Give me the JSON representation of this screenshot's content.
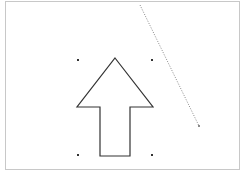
{
  "canvas": {
    "background": "#ffffff",
    "border_color": "#c8c8c8"
  },
  "shapes": {
    "arrow": {
      "type": "up-arrow",
      "stroke": "#333333",
      "fill": "#ffffff",
      "points": "115,58 153,107 130,107 130,156 100,156 100,107 77,107"
    },
    "selection_handles": {
      "color": "#333333",
      "positions": [
        [
          78,
          60
        ],
        [
          152,
          60
        ],
        [
          78,
          155
        ],
        [
          152,
          155
        ]
      ]
    },
    "dotted_line": {
      "stroke": "#888888",
      "x1": 140,
      "y1": 5,
      "x2": 199,
      "y2": 126
    }
  }
}
